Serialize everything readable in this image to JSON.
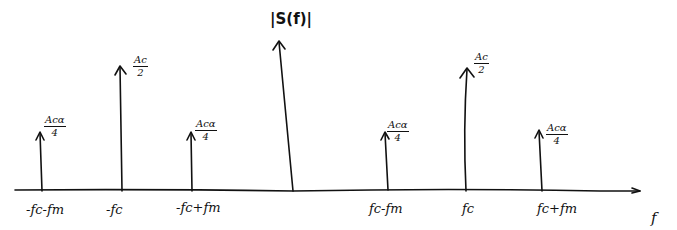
{
  "diagram": {
    "title": "|S(f)|",
    "axis": {
      "x_label": "f",
      "y_label": "|S(f)|"
    },
    "impulses": [
      {
        "id": "neg-fc-minus-fm",
        "tick_label": "-fc-fm",
        "amplitude_num": "Acα",
        "amplitude_den": "4",
        "x": 42,
        "top": 132
      },
      {
        "id": "neg-fc",
        "tick_label": "-fc",
        "amplitude_num": "Ac",
        "amplitude_den": "2",
        "x": 122,
        "top": 66
      },
      {
        "id": "neg-fc-plus-fm",
        "tick_label": "-fc+fm",
        "amplitude_num": "Acα",
        "amplitude_den": "4",
        "x": 192,
        "top": 132
      },
      {
        "id": "fc-minus-fm",
        "tick_label": "fc-fm",
        "amplitude_num": "Acα",
        "amplitude_den": "4",
        "x": 388,
        "top": 132
      },
      {
        "id": "fc",
        "tick_label": "fc",
        "amplitude_num": "Ac",
        "amplitude_den": "2",
        "x": 466,
        "top": 68
      },
      {
        "id": "fc-plus-fm",
        "tick_label": "fc+fm",
        "amplitude_num": "Acα",
        "amplitude_den": "4",
        "x": 542,
        "top": 130
      }
    ],
    "colors": {
      "ink": "#111111",
      "background": "#ffffff"
    }
  }
}
